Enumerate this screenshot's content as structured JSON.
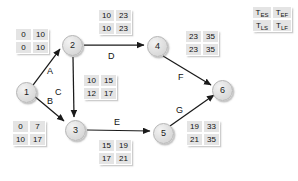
{
  "diagram": {
    "nodes": [
      {
        "id": "1",
        "label": "1",
        "x": 16,
        "y": 82
      },
      {
        "id": "2",
        "label": "2",
        "x": 62,
        "y": 35
      },
      {
        "id": "3",
        "label": "3",
        "x": 65,
        "y": 120
      },
      {
        "id": "4",
        "label": "4",
        "x": 147,
        "y": 36
      },
      {
        "id": "5",
        "label": "5",
        "x": 153,
        "y": 123
      },
      {
        "id": "6",
        "label": "6",
        "x": 212,
        "y": 80
      }
    ],
    "edges": [
      {
        "label": "A",
        "from": "1",
        "to": "2",
        "lx": 47,
        "ly": 66
      },
      {
        "label": "B",
        "from": "1",
        "to": "3",
        "lx": 47,
        "ly": 96
      },
      {
        "label": "C",
        "from": "2",
        "to": "3",
        "lx": 64,
        "ly": 87
      },
      {
        "label": "D",
        "from": "2",
        "to": "4",
        "lx": 108,
        "ly": 51
      },
      {
        "label": "E",
        "from": "3",
        "to": "5",
        "lx": 114,
        "ly": 119
      },
      {
        "label": "F",
        "from": "4",
        "to": "6",
        "lx": 178,
        "ly": 72
      },
      {
        "label": "G",
        "from": "5",
        "to": "6",
        "lx": 176,
        "ly": 105
      }
    ],
    "tables": [
      {
        "activity": "A",
        "tes": "0",
        "tef": "10",
        "tls": "0",
        "tlf": "10",
        "x": 15,
        "y": 28
      },
      {
        "activity": "B",
        "tes": "0",
        "tef": "7",
        "tls": "10",
        "tlf": "17",
        "x": 12,
        "y": 120
      },
      {
        "activity": "C",
        "tes": "10",
        "tef": "15",
        "tls": "12",
        "tlf": "17",
        "x": 83,
        "y": 74
      },
      {
        "activity": "D",
        "tes": "10",
        "tef": "23",
        "tls": "10",
        "tlf": "23",
        "x": 98,
        "y": 9
      },
      {
        "activity": "E",
        "tes": "15",
        "tef": "19",
        "tls": "17",
        "tlf": "21",
        "x": 98,
        "y": 139
      },
      {
        "activity": "F",
        "tes": "23",
        "tef": "35",
        "tls": "23",
        "tlf": "35",
        "x": 185,
        "y": 30
      },
      {
        "activity": "G",
        "tes": "19",
        "tef": "33",
        "tls": "21",
        "tlf": "35",
        "x": 186,
        "y": 120
      }
    ],
    "legend": {
      "name": "time-box-legend",
      "x": 252,
      "y": 6,
      "tes_base": "T",
      "tes_sub": "ES",
      "tef_base": "T",
      "tef_sub": "EF",
      "tls_base": "T",
      "tls_sub": "LS",
      "tlf_base": "T",
      "tlf_sub": "LF"
    },
    "colors": {
      "background": "#ffffff",
      "node_fill": "#e2e2e2",
      "node_stroke": "#b4b4b4",
      "cell_fill": "#e4e4e4",
      "cell_border": "#ffffff",
      "edge_stroke": "#1a1a1a",
      "text": "#111111"
    }
  }
}
